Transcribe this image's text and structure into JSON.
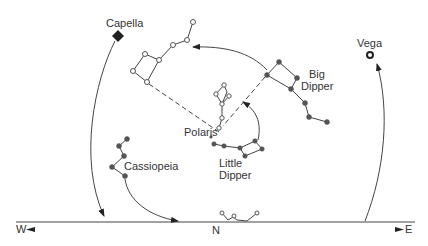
{
  "diagram": {
    "labels": {
      "capella": "Capella",
      "vega": "Vega",
      "big_dipper_line1": "Big",
      "big_dipper_line2": "Dipper",
      "polaris": "Polaris",
      "little_dipper_line1": "Little",
      "little_dipper_line2": "Dipper",
      "cassiopeia": "Cassiopeia",
      "west": "W",
      "north": "N",
      "east": "E"
    },
    "icons": {
      "capella": "filled-star-icon",
      "vega": "ring-star-icon",
      "filled_star": "filled-circle",
      "open_star": "open-circle",
      "arrow": "arrowhead"
    },
    "colors": {
      "line": "#444444",
      "filled_star": "#555555",
      "text": "#333333",
      "background": "#ffffff"
    }
  }
}
